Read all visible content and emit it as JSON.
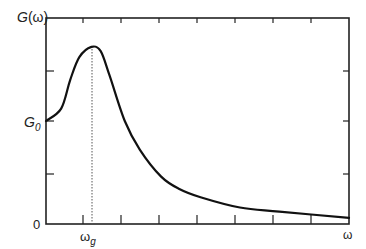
{
  "chart_data": {
    "type": "line",
    "title": "",
    "xlabel": "ω",
    "ylabel": "G(ω)",
    "y_ticks_labeled": [
      {
        "label": "0",
        "value": 0
      },
      {
        "label": "G0",
        "value": "G0"
      }
    ],
    "x_ticks_labeled": [
      {
        "label": "ωg",
        "value": "ωg"
      }
    ],
    "annotations": [
      {
        "type": "dotted-vertical-line",
        "at_x": "ωg",
        "from_y": 0,
        "to_y": "peak"
      }
    ],
    "series": [
      {
        "name": "G(ω)",
        "description": "Resonance-shaped curve: starts at G0 at ω=0, rises to a peak at ωg (~1.5×G0), then decays toward 0 as ω increases",
        "points_normalized": [
          {
            "x": 0.0,
            "y": 0.5
          },
          {
            "x": 0.05,
            "y": 0.56
          },
          {
            "x": 0.08,
            "y": 0.7
          },
          {
            "x": 0.11,
            "y": 0.81
          },
          {
            "x": 0.15,
            "y": 0.86
          },
          {
            "x": 0.18,
            "y": 0.84
          },
          {
            "x": 0.21,
            "y": 0.72
          },
          {
            "x": 0.26,
            "y": 0.5
          },
          {
            "x": 0.31,
            "y": 0.36
          },
          {
            "x": 0.38,
            "y": 0.23
          },
          {
            "x": 0.44,
            "y": 0.17
          },
          {
            "x": 0.51,
            "y": 0.13
          },
          {
            "x": 0.64,
            "y": 0.08
          },
          {
            "x": 0.77,
            "y": 0.06
          },
          {
            "x": 1.0,
            "y": 0.03
          }
        ]
      }
    ],
    "grid": false,
    "legend": null,
    "frame": "box with inward ticks on all four sides"
  },
  "labels": {
    "y_axis_title_main": "G",
    "y_axis_title_arg": "(ω)",
    "y_g0_main": "G",
    "y_g0_sub": "0",
    "y_zero": "0",
    "x_wg_main": "ω",
    "x_wg_sub": "g",
    "x_axis_title": "ω"
  }
}
